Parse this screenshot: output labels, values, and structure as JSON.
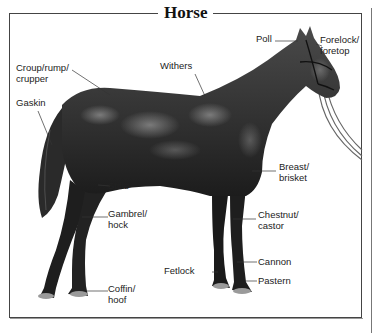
{
  "title": "Horse",
  "labels": {
    "poll": "Poll",
    "forelock_1": "Forelock/",
    "forelock_2": "foretop",
    "croup_1": "Croup/rump/",
    "croup_2": "crupper",
    "withers": "Withers",
    "gaskin": "Gaskin",
    "breast_1": "Breast/",
    "breast_2": "brisket",
    "stifle": "Stifle",
    "gambrel_1": "Gambrel/",
    "gambrel_2": "hock",
    "chestnut_1": "Chestnut/",
    "chestnut_2": "castor",
    "fetlock": "Fetlock",
    "cannon": "Cannon",
    "pastern": "Pastern",
    "coffin_1": "Coffin/",
    "coffin_2": "hoof"
  },
  "colors": {
    "horse_body": "#3a3a3a",
    "horse_dark": "#1a1a1a",
    "highlight": "#8a8a8a",
    "hoof": "#9a9a9a",
    "line": "#333333"
  }
}
